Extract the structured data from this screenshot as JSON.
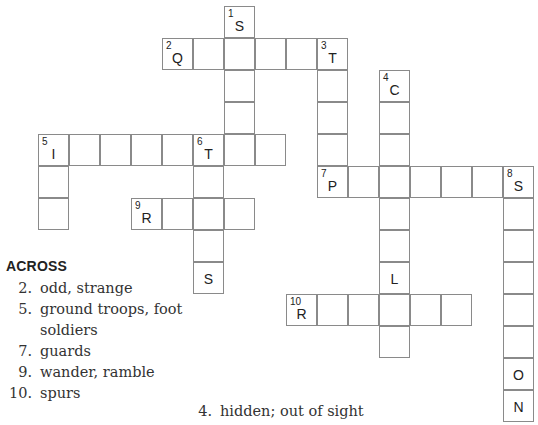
{
  "puzzle": {
    "cell": {
      "w": 31,
      "h": 32,
      "origin_x": 38,
      "origin_y": 6
    },
    "cells": [
      {
        "c": 6,
        "r": 0,
        "num": "1",
        "letter": "S"
      },
      {
        "c": 6,
        "r": 1
      },
      {
        "c": 6,
        "r": 2
      },
      {
        "c": 6,
        "r": 3
      },
      {
        "c": 4,
        "r": 1,
        "num": "2",
        "letter": "Q"
      },
      {
        "c": 5,
        "r": 1
      },
      {
        "c": 7,
        "r": 1
      },
      {
        "c": 8,
        "r": 1
      },
      {
        "c": 9,
        "r": 1,
        "num": "3",
        "letter": "T"
      },
      {
        "c": 9,
        "r": 2
      },
      {
        "c": 9,
        "r": 3
      },
      {
        "c": 9,
        "r": 4
      },
      {
        "c": 11,
        "r": 2,
        "num": "4",
        "letter": "C"
      },
      {
        "c": 11,
        "r": 3
      },
      {
        "c": 11,
        "r": 4
      },
      {
        "c": 11,
        "r": 6
      },
      {
        "c": 11,
        "r": 7
      },
      {
        "c": 11,
        "r": 8,
        "letter": "L"
      },
      {
        "c": 11,
        "r": 10
      },
      {
        "c": 0,
        "r": 4,
        "num": "5",
        "letter": "I"
      },
      {
        "c": 1,
        "r": 4
      },
      {
        "c": 2,
        "r": 4
      },
      {
        "c": 3,
        "r": 4
      },
      {
        "c": 4,
        "r": 4
      },
      {
        "c": 5,
        "r": 4,
        "num": "6",
        "letter": "T"
      },
      {
        "c": 6,
        "r": 4
      },
      {
        "c": 7,
        "r": 4
      },
      {
        "c": 0,
        "r": 5
      },
      {
        "c": 0,
        "r": 6
      },
      {
        "c": 5,
        "r": 5
      },
      {
        "c": 5,
        "r": 7
      },
      {
        "c": 5,
        "r": 8,
        "letter": "S"
      },
      {
        "c": 9,
        "r": 5,
        "num": "7",
        "letter": "P"
      },
      {
        "c": 10,
        "r": 5
      },
      {
        "c": 11,
        "r": 5
      },
      {
        "c": 12,
        "r": 5
      },
      {
        "c": 13,
        "r": 5
      },
      {
        "c": 14,
        "r": 5
      },
      {
        "c": 15,
        "r": 5,
        "num": "8",
        "letter": "S"
      },
      {
        "c": 15,
        "r": 6
      },
      {
        "c": 15,
        "r": 7
      },
      {
        "c": 15,
        "r": 8
      },
      {
        "c": 15,
        "r": 9
      },
      {
        "c": 15,
        "r": 10
      },
      {
        "c": 15,
        "r": 11,
        "letter": "O"
      },
      {
        "c": 15,
        "r": 12,
        "letter": "N"
      },
      {
        "c": 3,
        "r": 6,
        "num": "9",
        "letter": "R"
      },
      {
        "c": 4,
        "r": 6
      },
      {
        "c": 5,
        "r": 6
      },
      {
        "c": 6,
        "r": 6
      },
      {
        "c": 8,
        "r": 9,
        "num": "10",
        "letter": "R"
      },
      {
        "c": 9,
        "r": 9
      },
      {
        "c": 10,
        "r": 9
      },
      {
        "c": 11,
        "r": 9
      },
      {
        "c": 12,
        "r": 9
      },
      {
        "c": 13,
        "r": 9
      }
    ]
  },
  "across": {
    "heading": "ACROSS",
    "clues": [
      {
        "num": "2.",
        "text": "odd, strange"
      },
      {
        "num": "5.",
        "text": "ground troops, foot soldiers"
      },
      {
        "num": "7.",
        "text": "guards"
      },
      {
        "num": "9.",
        "text": "wander, ramble"
      },
      {
        "num": "10.",
        "text": "spurs"
      }
    ]
  },
  "down": {
    "clues": [
      {
        "num": "4.",
        "text": "hidden; out of sight"
      }
    ]
  }
}
